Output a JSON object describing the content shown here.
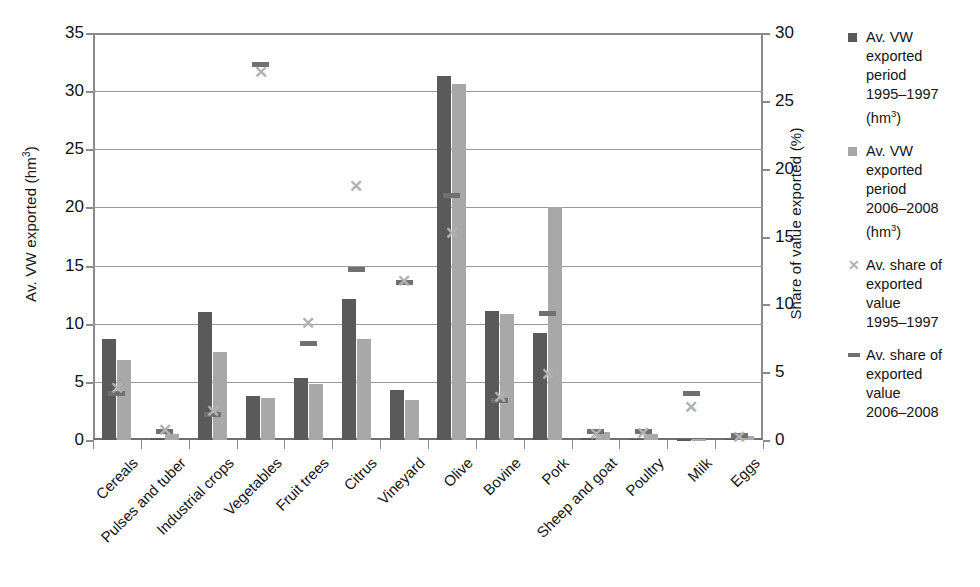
{
  "chart_data": {
    "type": "bar",
    "title": "",
    "categories": [
      "Cereals",
      "Pulses and tuber",
      "Industrial crops",
      "Vegetables",
      "Fruit trees",
      "Citrus",
      "Vineyard",
      "Olive",
      "Bovine",
      "Pork",
      "Sheep and goat",
      "Poultry",
      "Milk",
      "Eggs"
    ],
    "left_axis": {
      "label": "Av. VW exported (hm3)",
      "label_base": "Av. VW exported (hm",
      "label_sup": "3",
      "label_tail": ")",
      "ticks": [
        0,
        5,
        10,
        15,
        20,
        25,
        30,
        35
      ],
      "ylim": [
        0,
        35
      ]
    },
    "right_axis": {
      "label": "Share of value exported (%)",
      "ticks": [
        0,
        5,
        10,
        15,
        20,
        25,
        30
      ],
      "ylim": [
        0,
        30
      ]
    },
    "grid": true,
    "legend_position": "right",
    "series": [
      {
        "name": "Av. VW exported period 1995-1997 (hm3)",
        "type": "bar",
        "axis": "left",
        "color": "#5a5a5a",
        "values": [
          8.7,
          0.2,
          11.0,
          3.8,
          5.3,
          12.1,
          4.3,
          31.3,
          11.1,
          9.2,
          0.15,
          0.1,
          0.05,
          0.1
        ]
      },
      {
        "name": "Av. VW exported period 2006-2008 (hm3)",
        "type": "bar",
        "axis": "left",
        "color": "#a8a8a8",
        "values": [
          6.9,
          0.5,
          7.6,
          3.65,
          4.8,
          8.7,
          3.4,
          30.6,
          10.8,
          20.0,
          0.7,
          0.55,
          0.08,
          0.35
        ]
      },
      {
        "name": "Av. share of exported value 1995-1997",
        "type": "marker-x",
        "axis": "right",
        "color": "#b2b2b2",
        "values": [
          3.8,
          0.7,
          2.1,
          27.1,
          8.6,
          18.7,
          11.7,
          15.2,
          3.1,
          4.8,
          0.4,
          0.5,
          2.4,
          0.2
        ]
      },
      {
        "name": "Av. share of exported value 2006-2008",
        "type": "marker-dash",
        "axis": "right",
        "color": "#707070",
        "values": [
          3.4,
          0.6,
          1.9,
          27.7,
          7.1,
          12.6,
          11.6,
          18.0,
          2.9,
          9.3,
          0.6,
          0.6,
          3.4,
          0.3
        ]
      }
    ]
  },
  "axes": {
    "left_title_main": "Av. VW exported (hm",
    "left_title_sup": "3",
    "left_title_end": ")",
    "right_title": "Share of value exported (%)"
  },
  "legend": {
    "items": [
      {
        "marker": "square-dark-swatch-icon",
        "label": "Av. VW\nexported\nperiod\n1995–1997\n(hm",
        "sup": "3",
        "tail": ")"
      },
      {
        "marker": "square-light-swatch-icon",
        "label": "Av. VW\nexported\nperiod\n2006–2008\n(hm",
        "sup": "3",
        "tail": ")"
      },
      {
        "marker": "cross-marker-icon",
        "label": "Av. share of\nexported\nvalue\n1995–1997",
        "sup": "",
        "tail": ""
      },
      {
        "marker": "dash-marker-icon",
        "label": "Av. share of\nexported\nvalue\n2006–2008",
        "sup": "",
        "tail": ""
      }
    ]
  }
}
